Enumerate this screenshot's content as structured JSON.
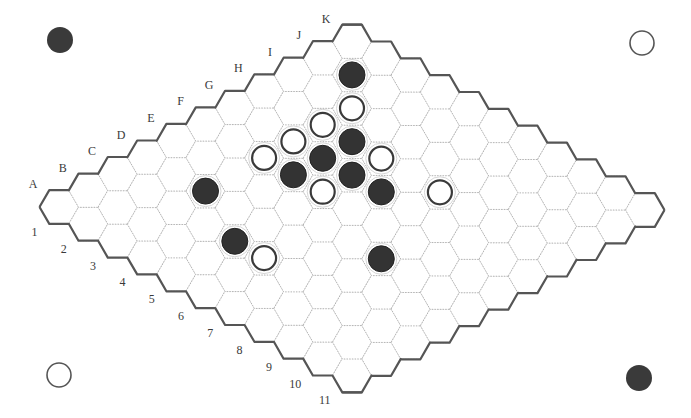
{
  "board": {
    "size": 11,
    "columns": [
      "A",
      "B",
      "C",
      "D",
      "E",
      "F",
      "G",
      "H",
      "I",
      "J",
      "K"
    ],
    "rows": [
      "1",
      "2",
      "3",
      "4",
      "5",
      "6",
      "7",
      "8",
      "9",
      "10",
      "11"
    ],
    "colors": {
      "black": "#333333",
      "white": "#ffffff",
      "border": "#555555",
      "grid": "#b4b4b4",
      "label": "#3a3a3a"
    }
  },
  "stones": [
    {
      "cell": "J2",
      "color": "black"
    },
    {
      "cell": "I3",
      "color": "white"
    },
    {
      "cell": "H3",
      "color": "white"
    },
    {
      "cell": "H4",
      "color": "black"
    },
    {
      "cell": "G3",
      "color": "white"
    },
    {
      "cell": "F3",
      "color": "white"
    },
    {
      "cell": "G4",
      "color": "black"
    },
    {
      "cell": "H5",
      "color": "white"
    },
    {
      "cell": "F4",
      "color": "black"
    },
    {
      "cell": "G5",
      "color": "black"
    },
    {
      "cell": "F5",
      "color": "white"
    },
    {
      "cell": "G6",
      "color": "black"
    },
    {
      "cell": "H7",
      "color": "white"
    },
    {
      "cell": "D3",
      "color": "black"
    },
    {
      "cell": "C5",
      "color": "black"
    },
    {
      "cell": "C6",
      "color": "white"
    },
    {
      "cell": "E8",
      "color": "black"
    }
  ],
  "corner_markers": [
    {
      "position": "top-left",
      "color": "black",
      "x": 60,
      "y": 40
    },
    {
      "position": "top-right",
      "color": "white",
      "x": 642,
      "y": 43
    },
    {
      "position": "bottom-left",
      "color": "white",
      "x": 59,
      "y": 375
    },
    {
      "position": "bottom-right",
      "color": "black",
      "x": 639,
      "y": 378
    }
  ]
}
